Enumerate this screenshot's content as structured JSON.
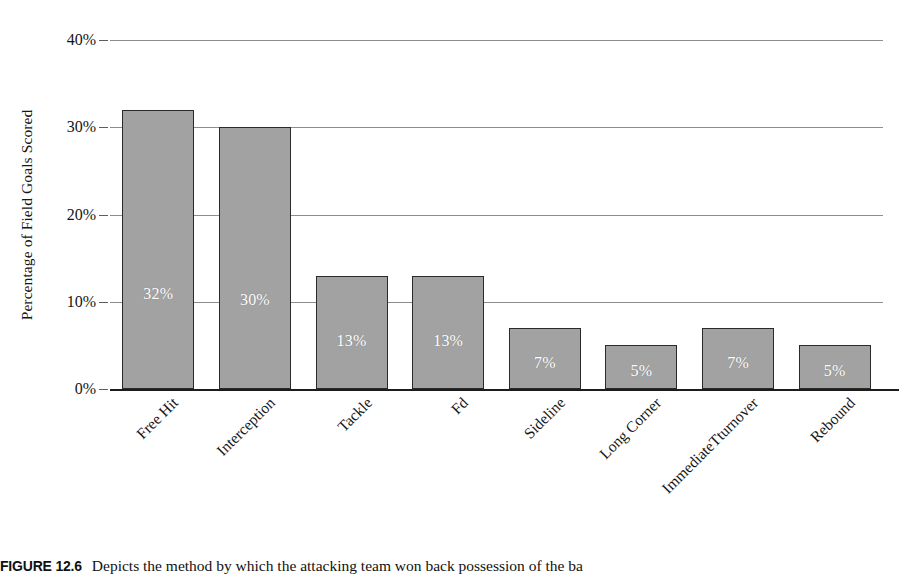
{
  "chart_data": {
    "type": "bar",
    "title": "",
    "xlabel": "",
    "ylabel": "Percentage of Field Goals Scored",
    "categories": [
      "Free Hit",
      "Interception",
      "Tackle",
      "Fd",
      "Sideline",
      "Long Corner",
      "ImmediateTturnover",
      "Rebound"
    ],
    "values": [
      32,
      30,
      13,
      13,
      7,
      5,
      7,
      5
    ],
    "value_labels": [
      "32%",
      "30%",
      "13%",
      "13%",
      "7%",
      "5%",
      "7%",
      "5%"
    ],
    "ylim": [
      0,
      40
    ],
    "yticks": [
      0,
      10,
      20,
      30,
      40
    ],
    "ytick_labels": [
      "0%",
      "10%",
      "20%",
      "30%",
      "40%"
    ],
    "grid": true,
    "legend": "none",
    "bar_color": "#a2a2a2",
    "bar_edge_color": "#2a2a2a",
    "value_label_color": "#ffffff",
    "gridline_color": "#8d8d8d",
    "axis_color": "#1d1d1d"
  },
  "caption": {
    "figure_number": "FIGURE 12.6",
    "text": "Depicts the method by which the attacking team won back possession of the ba"
  }
}
